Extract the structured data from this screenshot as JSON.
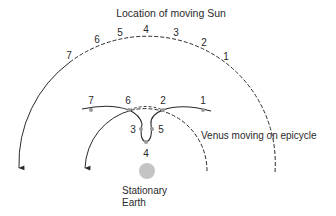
{
  "title": "Location of moving Sun",
  "sun_positions": [
    {
      "label": "1",
      "x": 226,
      "y": 60
    },
    {
      "label": "2",
      "x": 204,
      "y": 45
    },
    {
      "label": "3",
      "x": 176,
      "y": 35
    },
    {
      "label": "4",
      "x": 146,
      "y": 32
    },
    {
      "label": "5",
      "x": 120,
      "y": 35
    },
    {
      "label": "6",
      "x": 97,
      "y": 42
    },
    {
      "label": "7",
      "x": 69,
      "y": 58
    }
  ],
  "venus_positions": [
    {
      "label": "1",
      "x": 203,
      "y": 104,
      "dot_x": 203,
      "dot_y": 110
    },
    {
      "label": "2",
      "x": 163,
      "y": 104,
      "dot_x": 163,
      "dot_y": 110
    },
    {
      "label": "3",
      "x": 132,
      "y": 133,
      "dot_x": 140,
      "dot_y": 129
    },
    {
      "label": "4",
      "x": 146,
      "y": 157,
      "dot_x": 146,
      "dot_y": 142
    },
    {
      "label": "5",
      "x": 161,
      "y": 133,
      "dot_x": 153,
      "dot_y": 129
    },
    {
      "label": "6",
      "x": 128,
      "y": 104,
      "dot_x": 129,
      "dot_y": 110
    },
    {
      "label": "7",
      "x": 91,
      "y": 104,
      "dot_x": 91,
      "dot_y": 110
    }
  ],
  "venus_caption": "Venus moving on epicycle",
  "earth_label_line1": "Stationary",
  "earth_label_line2": "Earth",
  "colors": {
    "line": "#2a2a2a",
    "dot": "#9a9a9a",
    "earth": "#c4c4c4"
  }
}
